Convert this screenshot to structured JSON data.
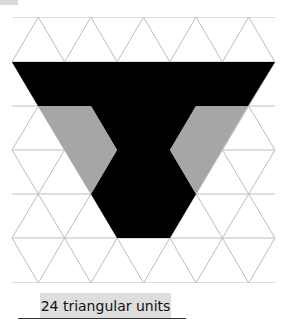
{
  "figure": {
    "caption": "24 triangular units",
    "grid": {
      "type": "isometric-triangular",
      "rows": 6,
      "row_lines_y": [
        17,
        62,
        106,
        150,
        194,
        238,
        283
      ],
      "x_left": 12,
      "x_right": 275,
      "triangle_side": 52.6,
      "line_color": "#bdbdbd"
    },
    "shapes": [
      {
        "name": "black-region",
        "fill": "#000000",
        "points": "12,62 275,62 248,106 196,106 170,150 196,194 170,238 117,238 91,194 117,150 91,106 38,106"
      },
      {
        "name": "grey-left-region",
        "fill": "#a6a6a6",
        "points": "38,106 91,106 117,150 91,194"
      },
      {
        "name": "grey-right-region",
        "fill": "#a6a6a6",
        "points": "196,106 248,106 196,194 170,150"
      }
    ]
  }
}
